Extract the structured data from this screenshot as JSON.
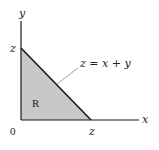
{
  "diagram": {
    "axes": {
      "x_label": "x",
      "y_label": "y",
      "origin_label": "0"
    },
    "ticks": {
      "x_intercept_label": "z",
      "y_intercept_label": "z"
    },
    "region": {
      "label": "R",
      "fill_color": "#c8c8c8"
    },
    "line": {
      "equation_label": "z = x + y",
      "color": "#1a1a1a"
    },
    "colors": {
      "axis": "#1a1a1a",
      "leader": "#888888"
    }
  }
}
